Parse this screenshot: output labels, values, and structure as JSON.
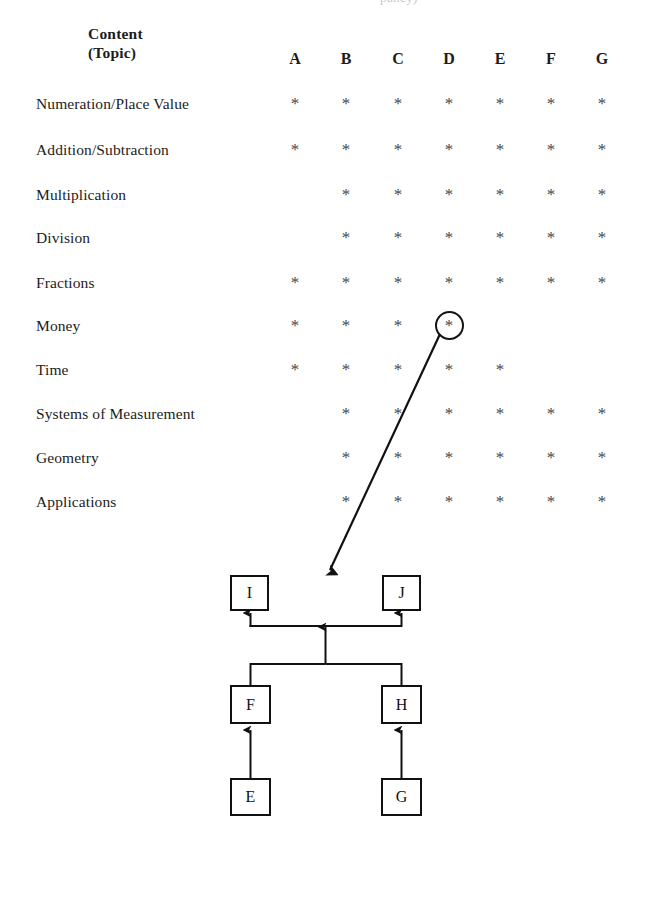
{
  "page": {
    "top_cutoff_text": "pancy)",
    "bottom_rule": "dotted-separator"
  },
  "matrix": {
    "header": {
      "line1": "Content",
      "line2": "(Topic)"
    },
    "columns": [
      "A",
      "B",
      "C",
      "D",
      "E",
      "F",
      "G"
    ],
    "column_x": [
      295,
      346,
      398,
      449,
      500,
      551,
      602
    ],
    "row_y": [
      104,
      150,
      195,
      238,
      283,
      326,
      370,
      414,
      458,
      502
    ],
    "star_glyph": "*",
    "rows": [
      {
        "label": "Numeration/Place Value",
        "marks": [
          1,
          1,
          1,
          1,
          1,
          1,
          1
        ],
        "circled": null
      },
      {
        "label": "Addition/Subtraction",
        "marks": [
          1,
          1,
          1,
          1,
          1,
          1,
          1
        ],
        "circled": null
      },
      {
        "label": "Multiplication",
        "marks": [
          0,
          1,
          1,
          1,
          1,
          1,
          1
        ],
        "circled": null
      },
      {
        "label": "Division",
        "marks": [
          0,
          1,
          1,
          1,
          1,
          1,
          1
        ],
        "circled": null
      },
      {
        "label": "Fractions",
        "marks": [
          1,
          1,
          1,
          1,
          1,
          1,
          1
        ],
        "circled": null
      },
      {
        "label": "Money",
        "marks": [
          1,
          1,
          1,
          1,
          0,
          0,
          0
        ],
        "circled": 3
      },
      {
        "label": "Time",
        "marks": [
          1,
          1,
          1,
          1,
          1,
          0,
          0
        ],
        "circled": null
      },
      {
        "label": "Systems of Measurement",
        "marks": [
          0,
          1,
          1,
          1,
          1,
          1,
          1
        ],
        "circled": null
      },
      {
        "label": "Geometry",
        "marks": [
          0,
          1,
          1,
          1,
          1,
          1,
          1
        ],
        "circled": null
      },
      {
        "label": "Applications",
        "marks": [
          0,
          1,
          1,
          1,
          1,
          1,
          1
        ],
        "circled": null
      }
    ]
  },
  "diagram": {
    "type": "hierarchy",
    "nodes": [
      {
        "id": "I",
        "label": "I",
        "x": 230,
        "y": 575,
        "w": 39,
        "h": 36
      },
      {
        "id": "J",
        "label": "J",
        "x": 382,
        "y": 575,
        "w": 39,
        "h": 36
      },
      {
        "id": "F",
        "label": "F",
        "x": 230,
        "y": 685,
        "w": 41,
        "h": 39
      },
      {
        "id": "H",
        "label": "H",
        "x": 381,
        "y": 685,
        "w": 41,
        "h": 39
      },
      {
        "id": "E",
        "label": "E",
        "x": 230,
        "y": 778,
        "w": 41,
        "h": 38
      },
      {
        "id": "G",
        "label": "G",
        "x": 381,
        "y": 778,
        "w": 41,
        "h": 38
      }
    ],
    "edges": [
      {
        "from": "E",
        "to": "F"
      },
      {
        "from": "G",
        "to": "H"
      },
      {
        "from": "F",
        "to": "junction-lower"
      },
      {
        "from": "H",
        "to": "junction-lower"
      },
      {
        "from": "junction-lower",
        "to": "junction-upper"
      },
      {
        "from": "junction-upper",
        "to": "I"
      },
      {
        "from": "junction-upper",
        "to": "J"
      }
    ],
    "callout": {
      "from_row": "Money",
      "from_column": "D",
      "start": [
        440,
        334
      ],
      "end": [
        328,
        572
      ]
    }
  }
}
